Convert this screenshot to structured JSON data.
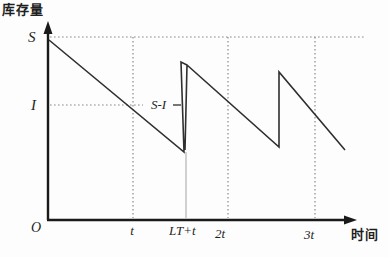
{
  "chart_data": {
    "type": "line",
    "title": "",
    "ylabel": "库存量",
    "xlabel": "时间",
    "y_tick_labels": [
      "S",
      "I"
    ],
    "x_tick_labels": [
      "O",
      "t",
      "LT+t",
      "2t",
      "3t"
    ],
    "annotation": "S-I",
    "legend": "none",
    "grid": "dotted guides at S level, I level and at t, 2t, 3t",
    "series": [
      {
        "name": "inventory-level",
        "x_units": "t",
        "y_units": "fraction of S",
        "points": [
          {
            "x": 0.0,
            "y": 1.0
          },
          {
            "x": 1.0,
            "y": 0.63,
            "note": "crosses reorder level I at time t"
          },
          {
            "x": 1.53,
            "y": 0.37,
            "note": "minimum just before replenishment at LT+t"
          },
          {
            "x": 1.53,
            "y": 0.86,
            "note": "jump of size S-I"
          },
          {
            "x": 2.57,
            "y": 0.4
          },
          {
            "x": 2.57,
            "y": 0.81,
            "note": "second replenishment jump"
          },
          {
            "x": 3.3,
            "y": 0.38
          }
        ]
      }
    ],
    "axis_ranges": {
      "x": [
        0,
        3.4
      ],
      "y": [
        0,
        1.1
      ]
    },
    "colors": {
      "axis": "#1a1a1a",
      "line": "#2f2f2f",
      "dotted": "#8a8a8a",
      "guide": "#bdbdbd",
      "text": "#1f1f1f",
      "background": "#fdfdfd"
    },
    "geometry": {
      "lines": [
        {
          "name": "y-axis",
          "x1": 48,
          "y1": 220,
          "x2": 48,
          "y2": 30,
          "c": "axis",
          "w": 2.4
        },
        {
          "name": "x-axis",
          "x1": 47,
          "y1": 220,
          "x2": 348,
          "y2": 220,
          "c": "axis",
          "w": 2.4
        },
        {
          "name": "s-level-dotted-line",
          "x1": 50,
          "y1": 37,
          "x2": 365,
          "y2": 37,
          "c": "dotted",
          "w": 1.2,
          "dash": "1.6 2.4"
        },
        {
          "name": "i-level-dotted-line",
          "x1": 50,
          "y1": 105,
          "x2": 143,
          "y2": 105,
          "c": "dotted",
          "w": 1.2,
          "dash": "1.6 2.4"
        },
        {
          "name": "t-vertical-dotted-line",
          "x1": 133,
          "y1": 37,
          "x2": 133,
          "y2": 218,
          "c": "dotted",
          "w": 1.2,
          "dash": "1.6 2.4"
        },
        {
          "name": "2t-vertical-dotted-line",
          "x1": 228,
          "y1": 37,
          "x2": 228,
          "y2": 218,
          "c": "dotted",
          "w": 1.2,
          "dash": "1.6 2.4"
        },
        {
          "name": "3t-vertical-dotted-line",
          "x1": 315,
          "y1": 37,
          "x2": 315,
          "y2": 218,
          "c": "dotted",
          "w": 1.2,
          "dash": "1.6 2.4"
        },
        {
          "name": "replenishment-guide-line",
          "x1": 186,
          "y1": 152,
          "x2": 186,
          "y2": 218,
          "c": "guide",
          "w": 1.4
        },
        {
          "name": "s-minus-i-callout-tick",
          "x1": 173,
          "y1": 105,
          "x2": 181,
          "y2": 105,
          "c": "line",
          "w": 1.3
        }
      ],
      "paths": [
        {
          "name": "inventory-sawtooth-curve",
          "d": "M49,40 L184,152 L181,62 L187,65 L185,150 M187,65 L279,147 L279,72 L345,150",
          "c": "line",
          "w": 1.6
        }
      ],
      "polygons": [
        {
          "name": "y-axis-arrowhead",
          "pts": "48,21 43.5,34 52.5,34",
          "c": "axis"
        },
        {
          "name": "x-axis-arrowhead",
          "pts": "357,220 344,215.5 344,224.5",
          "c": "axis"
        }
      ]
    }
  },
  "labels": {
    "ylabel": "库存量",
    "xlabel": "时间",
    "s": "S",
    "i": "I",
    "origin": "O",
    "t": "t",
    "lt_plus_t": "LT+t",
    "two_t": "2t",
    "three_t": "3t",
    "s_minus_i": "S-I"
  }
}
